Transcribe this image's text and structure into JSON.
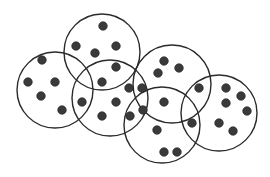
{
  "diagram": {
    "title": "",
    "type": "overlapping-circles-with-points",
    "colors": {
      "background": "#ffffff",
      "circle_stroke": "#2a2a2a",
      "point_fill": "#3a3a3a"
    },
    "point_radius": 4.3,
    "circles": [
      {
        "id": "left",
        "cx": 55,
        "cy": 90,
        "r": 38
      },
      {
        "id": "top-center",
        "cx": 102,
        "cy": 52,
        "r": 38
      },
      {
        "id": "center",
        "cx": 110,
        "cy": 98,
        "r": 38
      },
      {
        "id": "right-center",
        "cx": 172,
        "cy": 84,
        "r": 39
      },
      {
        "id": "bottom-center",
        "cx": 162,
        "cy": 125,
        "r": 38
      },
      {
        "id": "right",
        "cx": 219,
        "cy": 113,
        "r": 38
      }
    ],
    "points": [
      {
        "x": 103,
        "y": 26
      },
      {
        "x": 76,
        "y": 46
      },
      {
        "x": 116,
        "y": 46
      },
      {
        "x": 95,
        "y": 53
      },
      {
        "x": 116,
        "y": 67
      },
      {
        "x": 102,
        "y": 82
      },
      {
        "x": 42,
        "y": 60
      },
      {
        "x": 28,
        "y": 82
      },
      {
        "x": 55,
        "y": 82
      },
      {
        "x": 41,
        "y": 96
      },
      {
        "x": 62,
        "y": 110
      },
      {
        "x": 82,
        "y": 102
      },
      {
        "x": 116,
        "y": 102
      },
      {
        "x": 102,
        "y": 116
      },
      {
        "x": 129,
        "y": 88
      },
      {
        "x": 142,
        "y": 88
      },
      {
        "x": 130,
        "y": 116
      },
      {
        "x": 143,
        "y": 110
      },
      {
        "x": 164,
        "y": 61
      },
      {
        "x": 179,
        "y": 68
      },
      {
        "x": 158,
        "y": 73
      },
      {
        "x": 164,
        "y": 102
      },
      {
        "x": 157,
        "y": 130
      },
      {
        "x": 164,
        "y": 152
      },
      {
        "x": 177,
        "y": 152
      },
      {
        "x": 199,
        "y": 88
      },
      {
        "x": 192,
        "y": 123
      },
      {
        "x": 226,
        "y": 88
      },
      {
        "x": 241,
        "y": 96
      },
      {
        "x": 226,
        "y": 103
      },
      {
        "x": 247,
        "y": 111
      },
      {
        "x": 219,
        "y": 123
      },
      {
        "x": 233,
        "y": 131
      }
    ]
  }
}
